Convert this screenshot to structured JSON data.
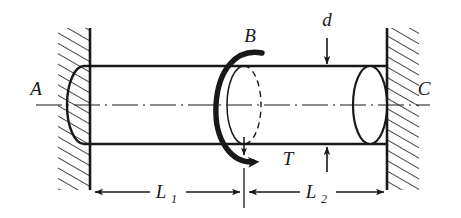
{
  "figure": {
    "type": "engineering-mechanics-diagram",
    "background_color": "#ffffff",
    "line_color": "#17181a"
  },
  "labels": {
    "support_left": "A",
    "torque_point": "B",
    "support_right": "C",
    "torque": "T",
    "diameter": "d",
    "length_left_base": "L",
    "length_left_sub": "1",
    "length_right_base": "L",
    "length_right_sub": "2"
  },
  "geometry": {
    "shaft_axis_y": 105,
    "shaft_top_y": 66,
    "shaft_bottom_y": 144,
    "wall_left_x": 90,
    "wall_right_x": 387,
    "section_b_x": 244,
    "ellipse_rx": 17,
    "ellipse_ry": 39,
    "dimension_line_y": 192
  },
  "annotations": {
    "diameter_dim_x": 327,
    "centerline_style": "dash-dot",
    "hatching_angle_deg": 60,
    "torque_direction": "counterclockwise-viewed-from-right"
  }
}
